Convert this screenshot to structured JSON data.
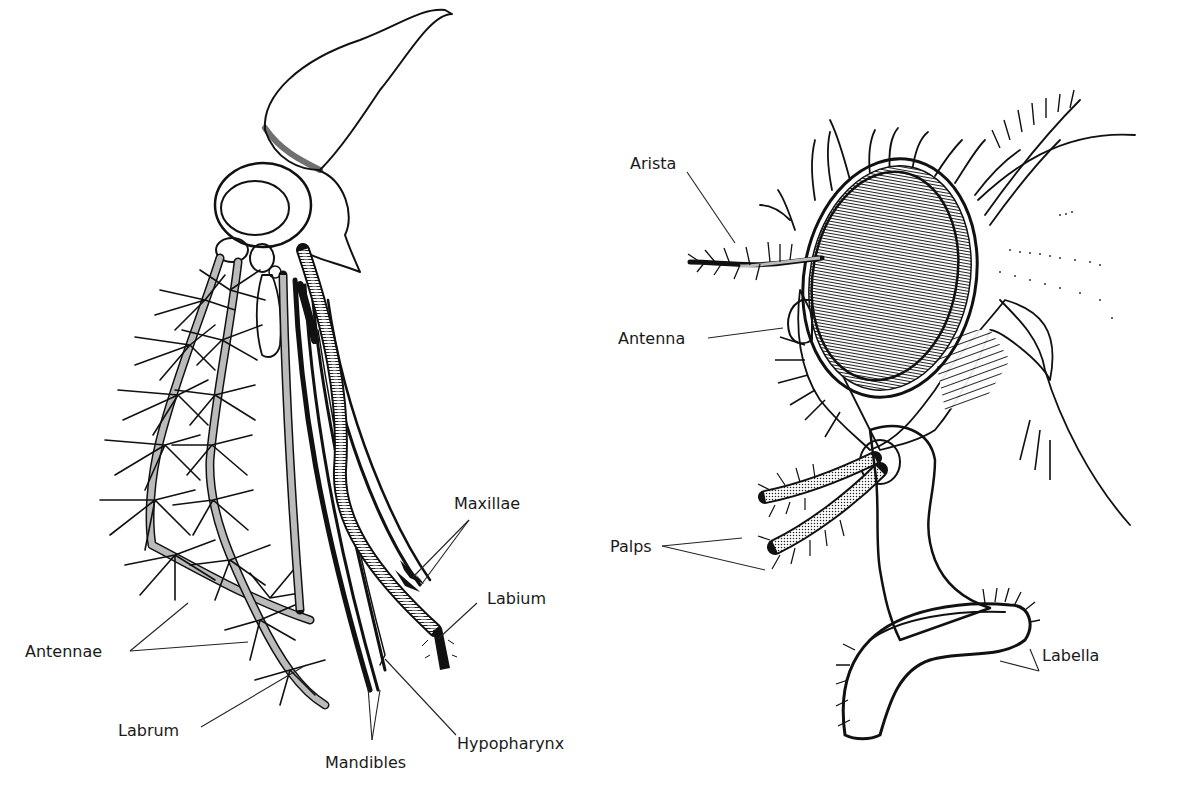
{
  "figure": {
    "left_panel": {
      "subject": "mosquito-head-piercing-mouthparts",
      "labels": [
        {
          "id": "antennae",
          "text": "Antennae"
        },
        {
          "id": "labrum",
          "text": "Labrum"
        },
        {
          "id": "mandibles",
          "text": "Mandibles"
        },
        {
          "id": "hypopharynx",
          "text": "Hypopharynx"
        },
        {
          "id": "labium",
          "text": "Labium"
        },
        {
          "id": "maxillae",
          "text": "Maxillae"
        }
      ]
    },
    "right_panel": {
      "subject": "housefly-head-sponging-mouthparts",
      "labels": [
        {
          "id": "arista",
          "text": "Arista"
        },
        {
          "id": "antenna",
          "text": "Antenna"
        },
        {
          "id": "palps",
          "text": "Palps"
        },
        {
          "id": "labella",
          "text": "Labella"
        }
      ]
    },
    "colors": {
      "ink": "#111111",
      "background": "#ffffff",
      "label": "#1a1a1a"
    }
  }
}
